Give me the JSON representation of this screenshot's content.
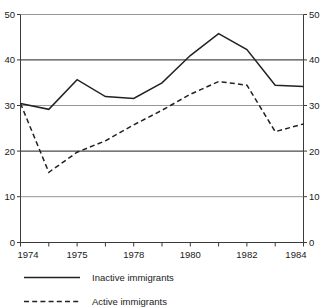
{
  "chart_data": {
    "type": "line",
    "title": "",
    "subtitle": "",
    "xlabel": "",
    "ylabel": "",
    "xlim": [
      1974,
      1984
    ],
    "ylim": [
      0,
      50
    ],
    "grid": true,
    "legend_position": "bottom-left",
    "x": [
      1974,
      1975,
      1976,
      1977,
      1978,
      1979,
      1980,
      1981,
      1982,
      1983,
      1984
    ],
    "x_tick_labels": [
      "1974",
      "1975",
      "1978",
      "1980",
      "1982",
      "1984"
    ],
    "x_tick_label_positions": [
      1974,
      1976,
      1978,
      1980,
      1982,
      1984
    ],
    "y_ticks": [
      0,
      10,
      20,
      30,
      40,
      50
    ],
    "y_tick_labels_left": [
      "0",
      "10",
      "20",
      "30",
      "40",
      "50"
    ],
    "y_tick_labels_right": [
      "0",
      "10",
      "20",
      "30",
      "40",
      "50"
    ],
    "series": [
      {
        "name": "Inactive immigrants",
        "style": "solid",
        "color": "#222222",
        "values": [
          30.5,
          29.2,
          35.7,
          32.0,
          31.6,
          35.0,
          41.0,
          45.8,
          42.3,
          34.5,
          34.2
        ]
      },
      {
        "name": "Active immigrants",
        "style": "dashed",
        "color": "#222222",
        "values": [
          30.5,
          15.4,
          19.8,
          22.3,
          25.8,
          29.0,
          32.5,
          35.3,
          34.5,
          24.3,
          26.0
        ]
      }
    ]
  },
  "axes": {
    "left_axis_name": "left-value-axis",
    "right_axis_name": "right-value-axis",
    "bottom_axis_name": "year-axis"
  },
  "legend": {
    "items": [
      {
        "label": "Inactive immigrants",
        "style": "solid"
      },
      {
        "label": "Active immigrants",
        "style": "dashed"
      }
    ]
  },
  "colors": {
    "series": "#222222",
    "grid": "#4a4a4a",
    "grid_light": "#8a8a8a",
    "axis": "#3a3a3a",
    "background": "#ffffff",
    "text": "#1a1a1a"
  }
}
